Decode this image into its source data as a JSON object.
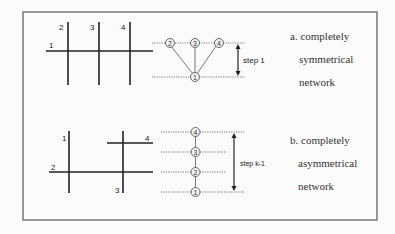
{
  "panel_a": {
    "caption": [
      "a. completely",
      "symmetrical",
      "network"
    ],
    "grid_labels": {
      "h": "1",
      "v1": "2",
      "v2": "3",
      "v3": "4"
    },
    "tree_nodes": {
      "top": [
        "2",
        "3",
        "4"
      ],
      "bottom": "1"
    },
    "step_label": "step 1"
  },
  "panel_b": {
    "caption": [
      "b. completely",
      "asymmetrical",
      "network"
    ],
    "grid_labels": {
      "v1": "1",
      "h1": "2",
      "v2": "3",
      "h2": "4"
    },
    "chain_nodes": [
      "4",
      "3",
      "2",
      "1"
    ],
    "step_label": "step k-1"
  }
}
